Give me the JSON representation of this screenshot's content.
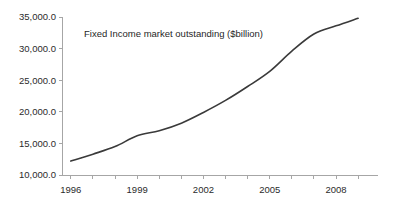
{
  "chart_data": {
    "type": "line",
    "title": "Fixed Income market outstanding ($billion)",
    "xlabel": "",
    "ylabel": "",
    "x": [
      1996,
      1997,
      1998,
      1999,
      2000,
      2001,
      2002,
      2003,
      2004,
      2005,
      2006,
      2007,
      2008,
      2009
    ],
    "values": [
      12200,
      13300,
      14500,
      16200,
      17000,
      18200,
      19900,
      21800,
      24000,
      26400,
      29600,
      32300,
      33600,
      34800
    ],
    "series": [
      {
        "name": "Fixed Income market outstanding",
        "values": [
          12200,
          13300,
          14500,
          16200,
          17000,
          18200,
          19900,
          21800,
          24000,
          26400,
          29600,
          32300,
          33600,
          34800
        ]
      }
    ],
    "xlim": [
      1996,
      1909.5
    ],
    "ylim": [
      10000,
      35000
    ],
    "x_axis_min": 1995.6,
    "x_axis_max": 2009.9,
    "y_ticks": [
      10000,
      15000,
      20000,
      25000,
      30000,
      35000
    ],
    "y_tick_labels": [
      "10,000.0",
      "15,000.0",
      "20,000.0",
      "25,000.0",
      "30,000.0",
      "35,000.0"
    ],
    "x_ticks": [
      1996,
      1997,
      1998,
      1999,
      2000,
      2001,
      2002,
      2003,
      2004,
      2005,
      2006,
      2007,
      2008,
      2009
    ],
    "x_tick_labels_shown": [
      "1996",
      "1999",
      "2002",
      "2005",
      "2008"
    ],
    "x_labeled_ticks": [
      1996,
      1999,
      2002,
      2005,
      2008
    ],
    "grid": false,
    "legend": "none",
    "line_color": "#3a3a3a",
    "axis_color": "#a6a6a6",
    "background_color": "#ffffff"
  }
}
